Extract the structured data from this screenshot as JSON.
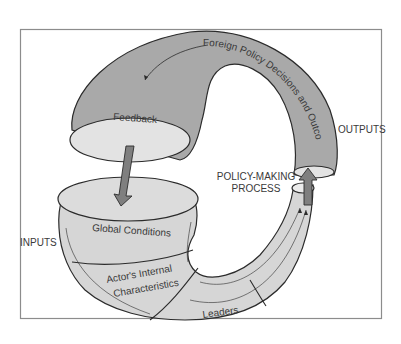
{
  "diagram": {
    "labels": {
      "inputs": "INPUTS",
      "outputs": "OUTPUTS",
      "process_line1": "POLICY-MAKING",
      "process_line2": "PROCESS",
      "feedback": "Feedback",
      "global_conditions": "Global Conditions",
      "actors_line1": "Actor's Internal",
      "actors_line2": "Characteristics",
      "leaders": "Leaders",
      "outcomes": "Foreign Policy Decisions and Outcomes"
    },
    "colors": {
      "dark_fill": "#a9a9a9",
      "light_fill": "#d6d6d6",
      "opening_fill": "#e3e3e3",
      "arrow_fill": "#7f7f7f",
      "stroke": "#2b2b2b",
      "frame": "#8c8c8c"
    }
  }
}
